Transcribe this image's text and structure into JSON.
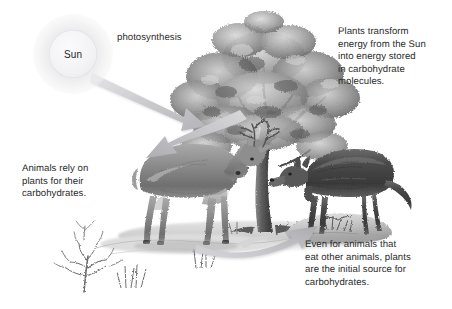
{
  "diagram": {
    "background_color": "#ffffff",
    "text_color": "#2b2b2b",
    "arrow_color": "#b9babd",
    "width": 452,
    "height": 309
  },
  "sun": {
    "label": "Sun",
    "disc_color": "#f1f1f3",
    "glow_color": "#e8e8ea"
  },
  "labels": {
    "photosynthesis": "photosynthesis"
  },
  "callouts": [
    {
      "id": "plants-transform",
      "text": "Plants transform\nenergy from the Sun\ninto energy stored\nin carbohydrate\nmolecules."
    },
    {
      "id": "animals-rely",
      "text": "Animals rely on\nplants for their\ncarbohydrates."
    },
    {
      "id": "carnivores",
      "text": "Even for animals that\neat other animals, plants\nare the initial source for\ncarbohydrates."
    }
  ],
  "arrows": [
    {
      "id": "sun-to-tree",
      "from": "sun",
      "to": "tree",
      "style": "straight-tapered",
      "label": "photosynthesis"
    },
    {
      "id": "tree-to-deer",
      "from": "tree",
      "to": "deer",
      "style": "curved-tapered",
      "label": ""
    },
    {
      "id": "deer-to-wolf",
      "from": "deer",
      "to": "wolf",
      "style": "curved-tapered",
      "label": ""
    }
  ],
  "illustrations": [
    {
      "id": "tree",
      "name": "oak-tree-illustration",
      "style": "pen-and-ink grayscale"
    },
    {
      "id": "deer",
      "name": "deer-illustration",
      "style": "pen-and-ink grayscale"
    },
    {
      "id": "wolf",
      "name": "wolf-illustration",
      "style": "pen-and-ink grayscale"
    },
    {
      "id": "shrub",
      "name": "bare-shrub-illustration",
      "style": "pen-and-ink grayscale"
    }
  ]
}
